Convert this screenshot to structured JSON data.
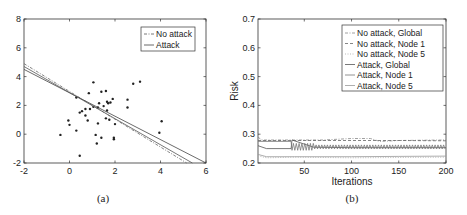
{
  "chart_data": [
    {
      "type": "scatter",
      "panel": "(a)",
      "caption": "(a)",
      "title": "",
      "xlabel": "",
      "ylabel": "",
      "xlim": [
        -2,
        6
      ],
      "ylim": [
        -2,
        8
      ],
      "xticks": [
        -2,
        0,
        2,
        4,
        6
      ],
      "yticks": [
        -2,
        0,
        2,
        4,
        6,
        8
      ],
      "xtick_labels": [
        "-2",
        "0",
        "2",
        "4",
        "6"
      ],
      "ytick_labels": [
        "-2",
        "0",
        "2",
        "4",
        "6",
        "8"
      ],
      "grid": false,
      "legend_position": "upper right",
      "legend": [
        "No attack",
        "Attack"
      ],
      "points": [
        [
          -0.4,
          -0.05
        ],
        [
          -0.05,
          0.95
        ],
        [
          0.0,
          0.65
        ],
        [
          0.3,
          0.25
        ],
        [
          0.3,
          2.55
        ],
        [
          0.45,
          -1.5
        ],
        [
          0.45,
          1.5
        ],
        [
          0.55,
          1.6
        ],
        [
          0.7,
          1.75
        ],
        [
          0.7,
          1.3
        ],
        [
          0.8,
          0.95
        ],
        [
          0.85,
          2.85
        ],
        [
          0.9,
          1.75
        ],
        [
          1.05,
          3.6
        ],
        [
          1.05,
          1.9
        ],
        [
          1.15,
          -0.05
        ],
        [
          1.2,
          -0.65
        ],
        [
          1.25,
          0.75
        ],
        [
          1.25,
          1.85
        ],
        [
          1.3,
          2.15
        ],
        [
          1.4,
          2.95
        ],
        [
          1.4,
          -0.25
        ],
        [
          1.5,
          1.95
        ],
        [
          1.6,
          1.1
        ],
        [
          1.6,
          3.0
        ],
        [
          1.65,
          2.25
        ],
        [
          1.65,
          1.65
        ],
        [
          1.7,
          2.15
        ],
        [
          1.75,
          1.0
        ],
        [
          1.8,
          2.2
        ],
        [
          1.9,
          2.45
        ],
        [
          1.95,
          -0.25
        ],
        [
          1.95,
          -0.35
        ],
        [
          2.0,
          0.7
        ],
        [
          2.55,
          2.4
        ],
        [
          2.55,
          1.85
        ],
        [
          2.8,
          3.5
        ],
        [
          3.1,
          3.65
        ],
        [
          3.95,
          0.1
        ],
        [
          4.05,
          0.9
        ]
      ],
      "series": [
        {
          "name": "No attack",
          "style": "dash-dot",
          "x": [
            -2,
            5.15
          ],
          "y": [
            4.9,
            -2.0
          ]
        },
        {
          "name": "Attack",
          "style": "solid",
          "x": [
            -2,
            6
          ],
          "y": [
            4.5,
            -2.0
          ]
        },
        {
          "name": "Attack (second line)",
          "style": "solid",
          "x": [
            -2,
            5.4
          ],
          "y": [
            4.7,
            -2.0
          ]
        }
      ]
    },
    {
      "type": "line",
      "panel": "(b)",
      "caption": "(b)",
      "title": "",
      "xlabel": "Iterations",
      "ylabel": "Risk",
      "xlim": [
        1,
        200
      ],
      "ylim": [
        0.2,
        0.7
      ],
      "xticks": [
        50,
        100,
        150,
        200
      ],
      "yticks": [
        0.2,
        0.3,
        0.4,
        0.5,
        0.6,
        0.7
      ],
      "xtick_labels": [
        "50",
        "100",
        "150",
        "200"
      ],
      "ytick_labels": [
        "0.2",
        "0.3",
        "0.4",
        "0.5",
        "0.6",
        "0.7"
      ],
      "grid": false,
      "legend_position": "upper right",
      "legend": [
        "No attack, Global",
        "No attack, Node 1",
        "No attack, Node 5",
        "Attack, Global",
        "Attack, Node 1",
        "Attack, Node 5"
      ],
      "series": [
        {
          "name": "No attack, Global",
          "style": "dash-dot",
          "x": [
            1,
            5,
            40,
            70,
            100,
            120,
            130,
            150,
            200
          ],
          "y": [
            0.29,
            0.28,
            0.28,
            0.28,
            0.285,
            0.285,
            0.275,
            0.278,
            0.28
          ]
        },
        {
          "name": "No attack, Node 1",
          "style": "dashed",
          "x": [
            1,
            40,
            100,
            150,
            200
          ],
          "y": [
            0.278,
            0.278,
            0.278,
            0.278,
            0.277
          ]
        },
        {
          "name": "No attack, Node 5",
          "style": "dotted",
          "x": [
            1,
            10,
            40,
            100,
            150,
            200
          ],
          "y": [
            0.225,
            0.218,
            0.22,
            0.218,
            0.219,
            0.22
          ]
        },
        {
          "name": "Attack, Global",
          "style": "solid",
          "x": [
            1,
            10,
            36,
            37,
            60,
            100,
            150,
            200
          ],
          "y": [
            0.26,
            0.25,
            0.25,
            0.28,
            0.255,
            0.253,
            0.253,
            0.253
          ]
        },
        {
          "name": "Attack, Node 1",
          "style": "solid",
          "note": "oscillating after ~37",
          "x": [
            1,
            36,
            37,
            60,
            100,
            150,
            200
          ],
          "y": [
            0.275,
            0.275,
            0.265,
            0.255,
            0.255,
            0.255,
            0.255
          ]
        },
        {
          "name": "Attack, Node 5",
          "style": "solid",
          "x": [
            1,
            10,
            40,
            100,
            150,
            200
          ],
          "y": [
            0.23,
            0.222,
            0.222,
            0.222,
            0.223,
            0.224
          ]
        }
      ]
    }
  ],
  "panel_a": {
    "caption": "(a)",
    "legend": [
      "No attack",
      "Attack"
    ],
    "xtick_labels": [
      "-2",
      "0",
      "2",
      "4",
      "6"
    ],
    "ytick_labels": [
      "-2",
      "0",
      "2",
      "4",
      "6",
      "8"
    ]
  },
  "panel_b": {
    "caption": "(b)",
    "xlabel": "Iterations",
    "ylabel": "Risk",
    "legend": [
      "No attack, Global",
      "No attack, Node 1",
      "No attack, Node 5",
      "Attack, Global",
      "Attack, Node 1",
      "Attack, Node 5"
    ],
    "xtick_labels": [
      "50",
      "100",
      "150",
      "200"
    ],
    "ytick_labels": [
      "0.2",
      "0.3",
      "0.4",
      "0.5",
      "0.6",
      "0.7"
    ]
  },
  "colors": {
    "axis": "#333333",
    "points": "#222222",
    "line_dark": "#444444",
    "line_mid": "#777777",
    "line_light": "#aaaaaa"
  }
}
